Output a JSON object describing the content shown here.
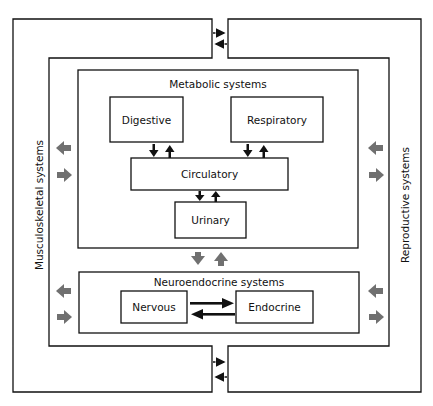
{
  "diagram": {
    "outer_left": {
      "label": "Musculoskeletal systems"
    },
    "outer_right": {
      "label": "Reproductive systems"
    },
    "metabolic": {
      "title": "Metabolic systems",
      "boxes": {
        "digestive": "Digestive",
        "respiratory": "Respiratory",
        "circulatory": "Circulatory",
        "urinary": "Urinary"
      }
    },
    "neuroendocrine": {
      "title": "Neuroendocrine systems",
      "boxes": {
        "nervous": "Nervous",
        "endocrine": "Endocrine"
      }
    },
    "colors": {
      "line": "#111111",
      "gray_arrow": "#707070",
      "background": "#ffffff"
    }
  }
}
